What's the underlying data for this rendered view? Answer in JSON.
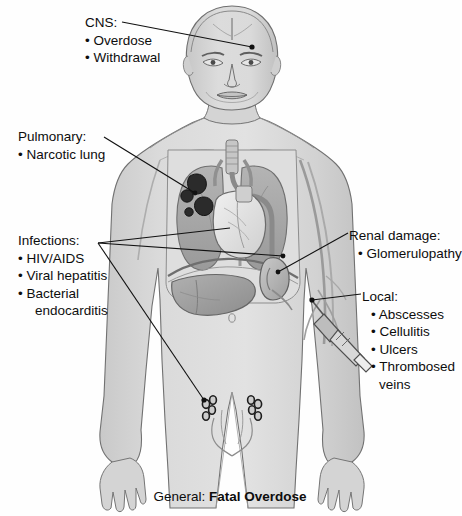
{
  "figure": {
    "title_prefix": "General:",
    "title_emphasis": "Fatal Overdose",
    "colors": {
      "background": "#fefefe",
      "body_fill": "#d6d6d6",
      "body_outline": "#6e6e6e",
      "organ_mid": "#a8a8a8",
      "organ_dark": "#7a7a7a",
      "lesion_dark": "#2a2a2a",
      "heart_light": "#e8e8e8",
      "leader_line": "#111111",
      "text": "#0d0d0d"
    }
  },
  "labels": {
    "cns": {
      "heading": "CNS:",
      "items": [
        "• Overdose",
        "• Withdrawal"
      ]
    },
    "pulmonary": {
      "heading": "Pulmonary:",
      "items": [
        "• Narcotic lung"
      ]
    },
    "infections": {
      "heading": "Infections:",
      "items": [
        "• HIV/AIDS",
        "• Viral hepatitis",
        "• Bacterial"
      ],
      "continuation": "endocarditis"
    },
    "renal": {
      "heading": "Renal damage:",
      "items": [
        "• Glomerulopathy"
      ]
    },
    "local": {
      "heading": "Local:",
      "items": [
        "• Abscesses",
        "• Cellulitis",
        "• Ulcers",
        "• Thrombosed"
      ],
      "continuation": "veins"
    }
  },
  "anatomy_parts": [
    "head-brain",
    "face",
    "neck",
    "trachea",
    "lungs",
    "lung-granulomas",
    "heart",
    "aorta",
    "diaphragm",
    "liver",
    "kidney",
    "inguinal-lymph-nodes",
    "arm-veins",
    "syringe-needle",
    "hands",
    "legs"
  ]
}
